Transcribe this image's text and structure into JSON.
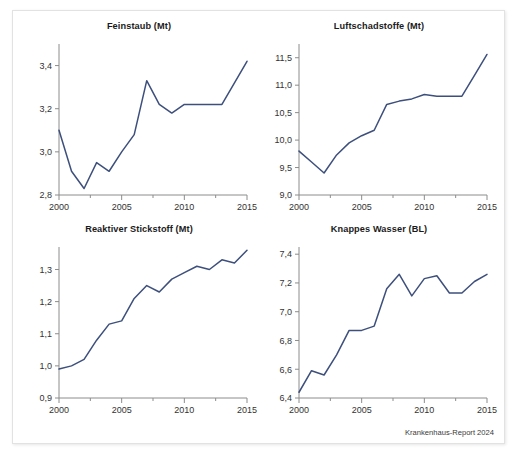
{
  "figure": {
    "source_note": "Krankenhaus-Report 2024",
    "line_color": "#3d4f7c",
    "axis_color": "#8c8c8c",
    "frame_color": "#e2e2e2",
    "background": "#ffffff"
  },
  "chart_data": [
    {
      "type": "line",
      "title": "Feinstaub (Mt)",
      "xlabel": "",
      "ylabel": "",
      "grid": false,
      "legend": "none",
      "xlim": [
        2000,
        2015
      ],
      "ylim": [
        2.8,
        3.5
      ],
      "xticks": [
        2000,
        2005,
        2010,
        2015
      ],
      "xtick_labels": [
        "2000",
        "2005",
        "2010",
        "2015"
      ],
      "xminor_ticks": [
        2001,
        2002,
        2003,
        2004,
        2006,
        2007,
        2008,
        2009,
        2011,
        2012,
        2013,
        2014
      ],
      "yticks": [
        2.8,
        3.0,
        3.2,
        3.4
      ],
      "ytick_labels": [
        "2,8",
        "3,0",
        "3,2",
        "3,4"
      ],
      "x": [
        2000,
        2001,
        2002,
        2003,
        2004,
        2005,
        2006,
        2007,
        2008,
        2009,
        2010,
        2011,
        2012,
        2013,
        2014,
        2015
      ],
      "values": [
        3.1,
        2.91,
        2.83,
        2.95,
        2.91,
        3.0,
        3.08,
        3.33,
        3.22,
        3.18,
        3.22,
        3.22,
        3.22,
        3.22,
        3.32,
        3.42
      ]
    },
    {
      "type": "line",
      "title": "Luftschadstoffe (Mt)",
      "xlabel": "",
      "ylabel": "",
      "grid": false,
      "legend": "none",
      "xlim": [
        2000,
        2015
      ],
      "ylim": [
        9.0,
        11.75
      ],
      "xticks": [
        2000,
        2005,
        2010,
        2015
      ],
      "xtick_labels": [
        "2000",
        "2005",
        "2010",
        "2015"
      ],
      "xminor_ticks": [
        2001,
        2002,
        2003,
        2004,
        2006,
        2007,
        2008,
        2009,
        2011,
        2012,
        2013,
        2014
      ],
      "yticks": [
        9.0,
        9.5,
        10.0,
        10.5,
        11.0,
        11.5
      ],
      "ytick_labels": [
        "9,0",
        "9,5",
        "10,0",
        "10,5",
        "11,0",
        "11,5"
      ],
      "x": [
        2000,
        2001,
        2002,
        2003,
        2004,
        2005,
        2006,
        2007,
        2008,
        2009,
        2010,
        2011,
        2012,
        2013,
        2014,
        2015
      ],
      "values": [
        9.8,
        9.6,
        9.4,
        9.73,
        9.95,
        10.08,
        10.18,
        10.65,
        10.71,
        10.75,
        10.83,
        10.8,
        10.8,
        10.8,
        11.18,
        11.56
      ]
    },
    {
      "type": "line",
      "title": "Reaktiver Stickstoff (Mt)",
      "xlabel": "",
      "ylabel": "",
      "grid": false,
      "legend": "none",
      "xlim": [
        2000,
        2015
      ],
      "ylim": [
        0.9,
        1.37
      ],
      "xticks": [
        2000,
        2005,
        2010,
        2015
      ],
      "xtick_labels": [
        "2000",
        "2005",
        "2010",
        "2015"
      ],
      "xminor_ticks": [
        2001,
        2002,
        2003,
        2004,
        2006,
        2007,
        2008,
        2009,
        2011,
        2012,
        2013,
        2014
      ],
      "yticks": [
        0.9,
        1.0,
        1.1,
        1.2,
        1.3
      ],
      "ytick_labels": [
        "0,9",
        "1,0",
        "1,1",
        "1,2",
        "1,3"
      ],
      "x": [
        2000,
        2001,
        2002,
        2003,
        2004,
        2005,
        2006,
        2007,
        2008,
        2009,
        2010,
        2011,
        2012,
        2013,
        2014,
        2015
      ],
      "values": [
        0.99,
        1.0,
        1.02,
        1.08,
        1.13,
        1.14,
        1.21,
        1.25,
        1.23,
        1.27,
        1.29,
        1.31,
        1.3,
        1.33,
        1.32,
        1.36
      ]
    },
    {
      "type": "line",
      "title": "Knappes Wasser (BL)",
      "xlabel": "",
      "ylabel": "",
      "grid": false,
      "legend": "none",
      "xlim": [
        2000,
        2015
      ],
      "ylim": [
        6.4,
        7.45
      ],
      "xticks": [
        2000,
        2005,
        2010,
        2015
      ],
      "xtick_labels": [
        "2000",
        "2005",
        "2010",
        "2015"
      ],
      "xminor_ticks": [
        2001,
        2002,
        2003,
        2004,
        2006,
        2007,
        2008,
        2009,
        2011,
        2012,
        2013,
        2014
      ],
      "yticks": [
        6.4,
        6.6,
        6.8,
        7.0,
        7.2,
        7.4
      ],
      "ytick_labels": [
        "6,4",
        "6,6",
        "6,8",
        "7,0",
        "7,2",
        "7,4"
      ],
      "x": [
        2000,
        2001,
        2002,
        2003,
        2004,
        2005,
        2006,
        2007,
        2008,
        2009,
        2010,
        2011,
        2012,
        2013,
        2014,
        2015
      ],
      "values": [
        6.44,
        6.59,
        6.56,
        6.7,
        6.87,
        6.87,
        6.9,
        7.16,
        7.26,
        7.11,
        7.23,
        7.25,
        7.13,
        7.13,
        7.21,
        7.26
      ]
    }
  ]
}
